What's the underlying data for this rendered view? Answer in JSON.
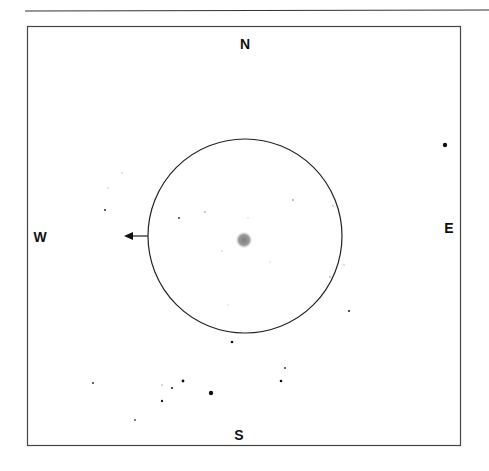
{
  "sketch": {
    "compass": {
      "north": "N",
      "south": "S",
      "east": "E",
      "west": "W"
    },
    "colors": {
      "line": "#222222",
      "star": "#111111",
      "galaxy": "#9a9a9a",
      "background": "#ffffff"
    },
    "field_of_view": {
      "cx": 245,
      "cy": 236,
      "r": 97
    },
    "motion_arrow": {
      "from": [
        148,
        236
      ],
      "to": [
        125,
        236
      ],
      "direction": "west"
    },
    "galaxy": {
      "cx": 244,
      "cy": 240,
      "r": 9
    },
    "stars": [
      {
        "x": 445,
        "y": 145,
        "r": 2.2,
        "o": 1
      },
      {
        "x": 105,
        "y": 210,
        "r": 1.0,
        "o": 0.9
      },
      {
        "x": 122,
        "y": 173,
        "r": 0.8,
        "o": 0.25
      },
      {
        "x": 108,
        "y": 188,
        "r": 0.8,
        "o": 0.25
      },
      {
        "x": 179,
        "y": 218,
        "r": 1.0,
        "o": 0.85
      },
      {
        "x": 205,
        "y": 212,
        "r": 0.8,
        "o": 0.5
      },
      {
        "x": 293,
        "y": 200,
        "r": 0.8,
        "o": 0.6
      },
      {
        "x": 333,
        "y": 206,
        "r": 0.8,
        "o": 0.3
      },
      {
        "x": 344,
        "y": 265,
        "r": 0.8,
        "o": 0.3
      },
      {
        "x": 330,
        "y": 277,
        "r": 0.8,
        "o": 0.5
      },
      {
        "x": 349,
        "y": 311,
        "r": 1.1,
        "o": 0.9
      },
      {
        "x": 232,
        "y": 342,
        "r": 1.3,
        "o": 1
      },
      {
        "x": 285,
        "y": 368,
        "r": 1.0,
        "o": 0.85
      },
      {
        "x": 281,
        "y": 381,
        "r": 1.3,
        "o": 1
      },
      {
        "x": 93,
        "y": 383,
        "r": 1.0,
        "o": 0.85
      },
      {
        "x": 162,
        "y": 385,
        "r": 0.8,
        "o": 0.4
      },
      {
        "x": 172,
        "y": 388,
        "r": 1.1,
        "o": 0.95
      },
      {
        "x": 183,
        "y": 381,
        "r": 1.4,
        "o": 1
      },
      {
        "x": 162,
        "y": 401,
        "r": 1.2,
        "o": 0.95
      },
      {
        "x": 211,
        "y": 393,
        "r": 2.2,
        "o": 1
      },
      {
        "x": 135,
        "y": 420,
        "r": 0.9,
        "o": 0.8
      },
      {
        "x": 248,
        "y": 218,
        "r": 0.7,
        "o": 0.2
      },
      {
        "x": 222,
        "y": 251,
        "r": 0.7,
        "o": 0.25
      },
      {
        "x": 270,
        "y": 262,
        "r": 0.7,
        "o": 0.2
      },
      {
        "x": 228,
        "y": 305,
        "r": 0.7,
        "o": 0.2
      }
    ]
  }
}
